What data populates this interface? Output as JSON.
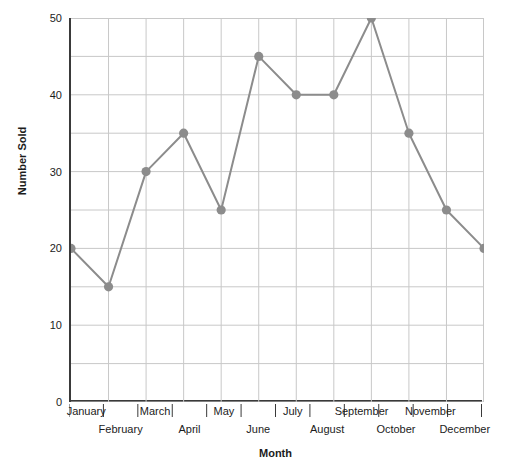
{
  "chart_data": {
    "type": "line",
    "title": "",
    "xlabel": "Month",
    "ylabel": "Number Sold",
    "categories": [
      "January",
      "February",
      "March",
      "April",
      "May",
      "June",
      "July",
      "August",
      "September",
      "October",
      "November",
      "December"
    ],
    "values": [
      20,
      15,
      30,
      35,
      25,
      45,
      40,
      40,
      50,
      35,
      25,
      20
    ],
    "series": [
      {
        "name": "Number Sold",
        "values": [
          20,
          15,
          30,
          35,
          25,
          45,
          40,
          40,
          50,
          35,
          25,
          20
        ]
      }
    ],
    "ylim": [
      0,
      50
    ],
    "ytick_labels": [
      "0",
      "10",
      "20",
      "30",
      "40",
      "50"
    ],
    "ytick_values": [
      0,
      10,
      20,
      30,
      40,
      50
    ],
    "gridline_step": 5,
    "grid": true,
    "legend": "none",
    "marker": "circle",
    "line_color": "#8c8c8c",
    "marker_color": "#8c8c8c",
    "grid_color": "#c8c8c8",
    "axis_color": "#3a3a3a",
    "text_color": "#1c1c1c"
  }
}
